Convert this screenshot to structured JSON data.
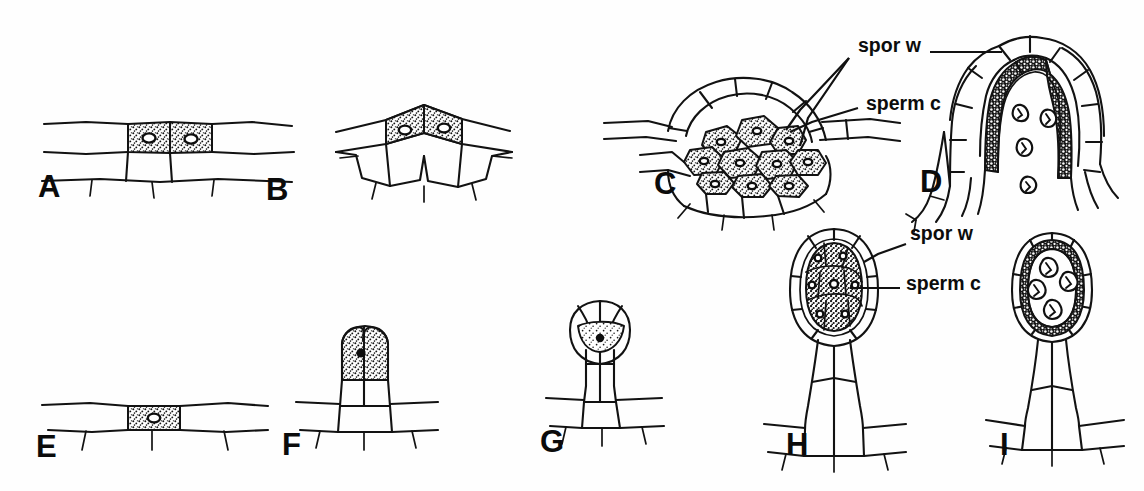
{
  "figure": {
    "background_color": "#ffffff",
    "ink_color": "#121212",
    "width": 1144,
    "height": 491
  },
  "callouts": [
    {
      "id": "c-spor-w",
      "text": "spor w",
      "x": 858,
      "y": 52,
      "meaning": "sporogenous wall"
    },
    {
      "id": "c-sperm-c",
      "text": "sperm c",
      "x": 866,
      "y": 110,
      "meaning": "sperm cell"
    },
    {
      "id": "h-spor-w",
      "text": "spor w",
      "x": 910,
      "y": 240,
      "meaning": "sporogenous wall"
    },
    {
      "id": "h-sperm-c",
      "text": "sperm c",
      "x": 906,
      "y": 290,
      "meaning": "sperm cell"
    }
  ],
  "panels": [
    {
      "letter": "A",
      "x": 38,
      "y": 197,
      "caption": "Two stippled antheridial initial cells in a flat surface layer, each with a nucleus"
    },
    {
      "letter": "B",
      "x": 266,
      "y": 200,
      "caption": "Raised peaked surface layer with two stippled initials"
    },
    {
      "letter": "C",
      "x": 654,
      "y": 194,
      "caption": "Dome of jacket cells enclosing a mass of stippled sperm cells"
    },
    {
      "letter": "D",
      "x": 920,
      "y": 192,
      "caption": "Elongate sunken antheridium with dark sporogenous wall and free sperm cells"
    },
    {
      "letter": "E",
      "x": 36,
      "y": 457,
      "caption": "Single stippled initial cell in a flat surface layer"
    },
    {
      "letter": "F",
      "x": 282,
      "y": 455,
      "caption": "Short-stalked antheridium with stippled apical cell"
    },
    {
      "letter": "G",
      "x": 540,
      "y": 452,
      "caption": "Stalked globular antheridium with jacket layer and stippled central cell"
    },
    {
      "letter": "H",
      "x": 786,
      "y": 455,
      "caption": "Mature stalked antheridium packed with sperm cells"
    },
    {
      "letter": "I",
      "x": 1000,
      "y": 455,
      "caption": "Stalked antheridium with dark wall and four free sperm cells"
    }
  ]
}
